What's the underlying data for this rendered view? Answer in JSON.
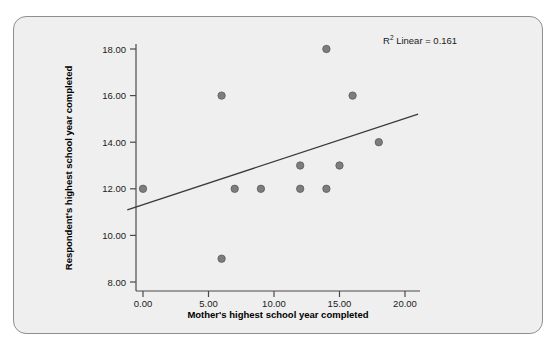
{
  "figure": {
    "background_color": "#ffffff",
    "panel_color": "#efefef",
    "panel_border_color": "#8f8f8f"
  },
  "chart_data": {
    "type": "scatter",
    "title": "",
    "subtitle": "",
    "xlabel": "Mother's highest school year completed",
    "ylabel": "Respondent's highest school year completed",
    "xlim": [
      -1.2,
      21.5
    ],
    "ylim": [
      7.2,
      18.9
    ],
    "xticks": [
      0,
      5,
      10,
      15,
      20
    ],
    "yticks": [
      8,
      10,
      12,
      14,
      16,
      18
    ],
    "xticklabels": [
      "0.00",
      "5.00",
      "10.00",
      "15.00",
      "20.00"
    ],
    "yticklabels": [
      "8.00",
      "10.00",
      "12.00",
      "14.00",
      "16.00",
      "18.00"
    ],
    "grid": false,
    "legend": null,
    "marker_color": "#7d7d7d",
    "marker_edge_color": "#5a5a5a",
    "marker_size": 5,
    "points": [
      {
        "x": 0,
        "y": 12
      },
      {
        "x": 6,
        "y": 16
      },
      {
        "x": 6,
        "y": 9
      },
      {
        "x": 7,
        "y": 12
      },
      {
        "x": 9,
        "y": 12
      },
      {
        "x": 12,
        "y": 13
      },
      {
        "x": 12,
        "y": 12
      },
      {
        "x": 14,
        "y": 18
      },
      {
        "x": 14,
        "y": 12
      },
      {
        "x": 15,
        "y": 13
      },
      {
        "x": 16,
        "y": 16
      },
      {
        "x": 18,
        "y": 14
      }
    ],
    "fit_line": {
      "type": "linear",
      "color": "#3a3a3a",
      "x_start": -1.2,
      "y_start": 11.1,
      "x_end": 21.0,
      "y_end": 15.2
    },
    "annotations": [
      {
        "name": "r-squared-annotation",
        "prefix": "R",
        "superscript": "2",
        "suffix": " Linear = 0.161",
        "full_text": "R2 Linear = 0.161",
        "x": 18.5,
        "y": 18.6
      }
    ]
  }
}
